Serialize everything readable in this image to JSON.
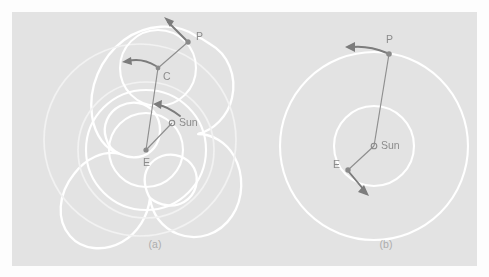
{
  "figure": {
    "background_color": "#fdfdfd",
    "panel_color": "#e3e3e3",
    "orbit_color": "#ffffff",
    "line_color": "#8e8e8e",
    "label_color": "#8c8c8c",
    "caption_color": "#adadad",
    "width": 489,
    "height": 277
  },
  "panels": [
    {
      "id": "a",
      "caption": "(a)",
      "caption_x": 155,
      "caption_y": 248,
      "model": "geocentric",
      "labels": {
        "earth": "E",
        "epicycle_center": "C",
        "planet": "P",
        "sun": "Sun"
      },
      "points": {
        "earth": {
          "x": 146,
          "y": 150,
          "marker": "dot"
        },
        "sun": {
          "x": 172,
          "y": 123,
          "marker": "ring"
        },
        "epicycle_center": {
          "x": 158,
          "y": 68,
          "marker": "dot"
        },
        "planet": {
          "x": 188,
          "y": 42,
          "marker": "dot"
        }
      },
      "label_positions": {
        "earth": {
          "x": 143,
          "y": 166
        },
        "sun": {
          "x": 179,
          "y": 126
        },
        "epicycle_center": {
          "x": 163,
          "y": 80
        },
        "planet": {
          "x": 196,
          "y": 40
        }
      },
      "circles": [
        {
          "name": "sun-orbit",
          "cx": 146,
          "cy": 150,
          "r": 37,
          "style": "orbit"
        },
        {
          "name": "deferent",
          "cx": 146,
          "cy": 150,
          "r": 60,
          "style": "orbit"
        },
        {
          "name": "deferent-outer",
          "cx": 146,
          "cy": 150,
          "r": 68,
          "style": "orbit-faint"
        },
        {
          "name": "epicycle",
          "cx": 158,
          "cy": 68,
          "r": 38,
          "style": "orbit"
        },
        {
          "name": "outer-guide",
          "cx": 140,
          "cy": 140,
          "r": 96,
          "style": "orbit-faint"
        }
      ],
      "radius_lines": [
        {
          "name": "earth-to-center",
          "from": "earth",
          "to": "epicycle_center"
        },
        {
          "name": "center-to-planet",
          "from": "epicycle_center",
          "to": "planet"
        },
        {
          "name": "earth-to-sun",
          "from": "earth",
          "to": "sun"
        }
      ],
      "motion_arrows": [
        {
          "name": "planet-motion-arrow",
          "description": "arrow at P pointing up-left"
        },
        {
          "name": "epicycle-motion-arrow",
          "description": "arrow at C pointing left"
        },
        {
          "name": "deferent-motion-arrow",
          "description": "curved arrow near Sun pointing counter-clockwise"
        }
      ],
      "trajectory": {
        "name": "epicycloid-path",
        "description": "looping retrograde epicycloid traced by the planet",
        "loops": 5
      }
    },
    {
      "id": "b",
      "caption": "(b)",
      "caption_x": 386,
      "caption_y": 248,
      "model": "heliocentric",
      "labels": {
        "sun": "Sun",
        "earth": "E",
        "planet": "P"
      },
      "points": {
        "sun": {
          "x": 374,
          "y": 146,
          "marker": "ring"
        },
        "earth": {
          "x": 348,
          "y": 170,
          "marker": "dot"
        },
        "planet": {
          "x": 389,
          "y": 54,
          "marker": "dot"
        }
      },
      "label_positions": {
        "sun": {
          "x": 381,
          "y": 149
        },
        "earth": {
          "x": 336,
          "y": 168
        },
        "planet": {
          "x": 388,
          "y": 43
        }
      },
      "circles": [
        {
          "name": "earth-orbit",
          "cx": 374,
          "cy": 146,
          "r": 40,
          "style": "orbit"
        },
        {
          "name": "planet-orbit",
          "cx": 374,
          "cy": 146,
          "r": 94,
          "style": "orbit"
        }
      ],
      "radius_lines": [
        {
          "name": "sun-to-planet",
          "from": "sun",
          "to": "planet"
        },
        {
          "name": "sun-to-earth",
          "from": "sun",
          "to": "earth"
        }
      ],
      "motion_arrows": [
        {
          "name": "planet-motion-arrow",
          "description": "arrow at P pointing left"
        },
        {
          "name": "earth-motion-arrow",
          "description": "arrow at E pointing down-right"
        }
      ]
    }
  ]
}
